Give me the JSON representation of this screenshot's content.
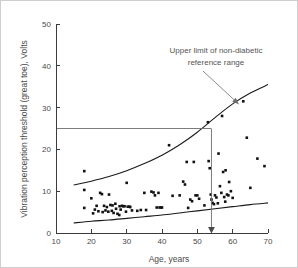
{
  "figure": {
    "background_color": "#ffffff",
    "border_color": "#cfcfcf",
    "point_color": "#111111",
    "curve_color": "#1a1a1a",
    "reference_line_color": "#6e6e6e"
  },
  "chart_data": {
    "type": "scatter",
    "title": "",
    "xlabel": "Age, years",
    "ylabel": "Vibration perception threshold (great toe), Volts",
    "xlim": [
      10,
      70
    ],
    "ylim": [
      0,
      50
    ],
    "xticks": [
      10,
      20,
      30,
      40,
      50,
      60,
      70
    ],
    "yticks": [
      0,
      10,
      20,
      30,
      40,
      50
    ],
    "xtick_labels": [
      "10",
      "20",
      "30",
      "40",
      "50",
      "60",
      "70"
    ],
    "ytick_labels": [
      "0",
      "10",
      "20",
      "30",
      "40",
      "50"
    ],
    "grid": false,
    "legend": null,
    "points": [
      [
        18,
        14.8
      ],
      [
        18,
        10.3
      ],
      [
        18,
        6.0
      ],
      [
        20,
        8.3
      ],
      [
        20.5,
        4.7
      ],
      [
        21,
        5.6
      ],
      [
        21.5,
        6.5
      ],
      [
        22,
        5.2
      ],
      [
        22.5,
        9.6
      ],
      [
        23,
        9.3
      ],
      [
        23.2,
        5.0
      ],
      [
        23.6,
        6.5
      ],
      [
        24,
        5.4
      ],
      [
        24.4,
        6.2
      ],
      [
        24.8,
        5.1
      ],
      [
        25,
        9.2
      ],
      [
        25.4,
        6.7
      ],
      [
        25.8,
        5.3
      ],
      [
        26,
        6.6
      ],
      [
        26.3,
        4.8
      ],
      [
        26.8,
        7.0
      ],
      [
        27,
        5.8
      ],
      [
        27.4,
        4.6
      ],
      [
        27.9,
        4.3
      ],
      [
        28,
        6.4
      ],
      [
        28.3,
        5.6
      ],
      [
        28.7,
        6.5
      ],
      [
        29,
        6.4
      ],
      [
        29.4,
        6.4
      ],
      [
        29.8,
        5.1
      ],
      [
        30,
        12.0
      ],
      [
        30.3,
        6.3
      ],
      [
        30.8,
        6.3
      ],
      [
        31,
        6.2
      ],
      [
        31.5,
        5.4
      ],
      [
        33,
        5.3
      ],
      [
        34,
        5.5
      ],
      [
        35,
        9.6
      ],
      [
        35.5,
        5.5
      ],
      [
        37,
        9.9
      ],
      [
        37.6,
        9.7
      ],
      [
        38,
        9.0
      ],
      [
        38.5,
        6.1
      ],
      [
        39,
        9.6
      ],
      [
        39.3,
        6.1
      ],
      [
        39.7,
        6.1
      ],
      [
        40,
        6.1
      ],
      [
        42,
        21.0
      ],
      [
        43,
        8.9
      ],
      [
        45,
        9.0
      ],
      [
        46,
        12.3
      ],
      [
        46.5,
        11.6
      ],
      [
        47,
        17.0
      ],
      [
        47.4,
        6.0
      ],
      [
        48,
        8.0
      ],
      [
        48.5,
        7.6
      ],
      [
        49,
        17.0
      ],
      [
        49.5,
        9.0
      ],
      [
        50,
        9.0
      ],
      [
        50.5,
        8.2
      ],
      [
        52,
        6.6
      ],
      [
        53,
        26.5
      ],
      [
        53.2,
        17.2
      ],
      [
        53.5,
        15.5
      ],
      [
        53.8,
        9.2
      ],
      [
        54,
        8.0
      ],
      [
        54.3,
        7.2
      ],
      [
        54.7,
        6.9
      ],
      [
        55,
        9.0
      ],
      [
        55.4,
        8.5
      ],
      [
        55.8,
        7.1
      ],
      [
        56,
        19.0
      ],
      [
        56.4,
        11.2
      ],
      [
        56.8,
        9.6
      ],
      [
        57,
        28.0
      ],
      [
        57.3,
        14.6
      ],
      [
        57.6,
        8.6
      ],
      [
        57.9,
        7.5
      ],
      [
        58,
        15.0
      ],
      [
        58.4,
        9.2
      ],
      [
        58.8,
        9.0
      ],
      [
        59,
        12.2
      ],
      [
        59.5,
        10.0
      ],
      [
        60,
        8.4
      ],
      [
        63,
        31.5
      ],
      [
        64,
        22.8
      ],
      [
        65,
        10.8
      ],
      [
        67,
        17.8
      ],
      [
        69,
        16.0
      ]
    ],
    "curves": [
      {
        "name": "upper-limit-curve",
        "label": "Upper limit of non-diabetic reference range",
        "x": [
          15,
          20,
          25,
          30,
          35,
          40,
          45,
          50,
          55,
          60,
          65,
          70
        ],
        "y": [
          11.5,
          12.4,
          13.5,
          14.9,
          16.6,
          18.6,
          21.1,
          24.1,
          27.6,
          30.9,
          33.5,
          35.5
        ]
      },
      {
        "name": "lower-limit-curve",
        "label": "",
        "x": [
          15,
          20,
          25,
          30,
          35,
          40,
          45,
          50,
          55,
          60,
          65,
          70
        ],
        "y": [
          2.4,
          2.8,
          3.1,
          3.5,
          3.9,
          4.3,
          4.8,
          5.3,
          5.8,
          6.3,
          6.8,
          7.2
        ]
      }
    ],
    "reference_line": {
      "name": "threshold-25V",
      "orientation": "horizontal",
      "y": 25,
      "x_start": 10,
      "x_end": 54
    },
    "pointer_line": {
      "name": "age-pointer-54",
      "orientation": "vertical",
      "x": 54,
      "y_start": 25,
      "y_end": 0,
      "arrow": "down"
    },
    "annotation": {
      "line1": "Upper limit of non-diabetic",
      "line2": "reference range",
      "target_x": 62,
      "target_y": 30.6
    }
  }
}
